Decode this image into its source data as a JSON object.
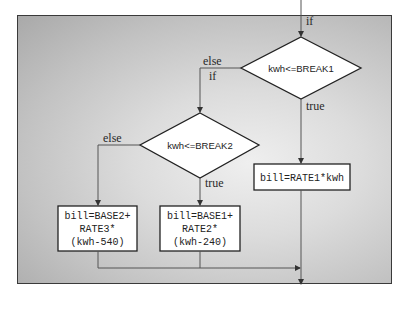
{
  "diagram": {
    "type": "flowchart",
    "entry_label": "if",
    "decisions": [
      {
        "id": "d1",
        "condition": "kwh<=BREAK1",
        "true_label": "true",
        "else_label": "else",
        "else_if_label": "if"
      },
      {
        "id": "d2",
        "condition": "kwh<=BREAK2",
        "true_label": "true",
        "else_label": "else"
      }
    ],
    "actions": [
      {
        "id": "a1",
        "lines": [
          "bill=RATE1*kwh"
        ]
      },
      {
        "id": "a2",
        "lines": [
          "bill=BASE1+",
          "RATE2*",
          "(kwh-240)"
        ]
      },
      {
        "id": "a3",
        "lines": [
          "bill=BASE2+",
          "RATE3*",
          "(kwh-540)"
        ]
      }
    ],
    "edges": [
      {
        "from": "start",
        "to": "d1",
        "label": "if"
      },
      {
        "from": "d1",
        "to": "a1",
        "label": "true"
      },
      {
        "from": "d1",
        "to": "d2",
        "label": "else if"
      },
      {
        "from": "d2",
        "to": "a2",
        "label": "true"
      },
      {
        "from": "d2",
        "to": "a3",
        "label": "else"
      },
      {
        "from": "a2",
        "to": "end"
      },
      {
        "from": "a3",
        "to": "end"
      },
      {
        "from": "a1",
        "to": "end"
      }
    ]
  }
}
